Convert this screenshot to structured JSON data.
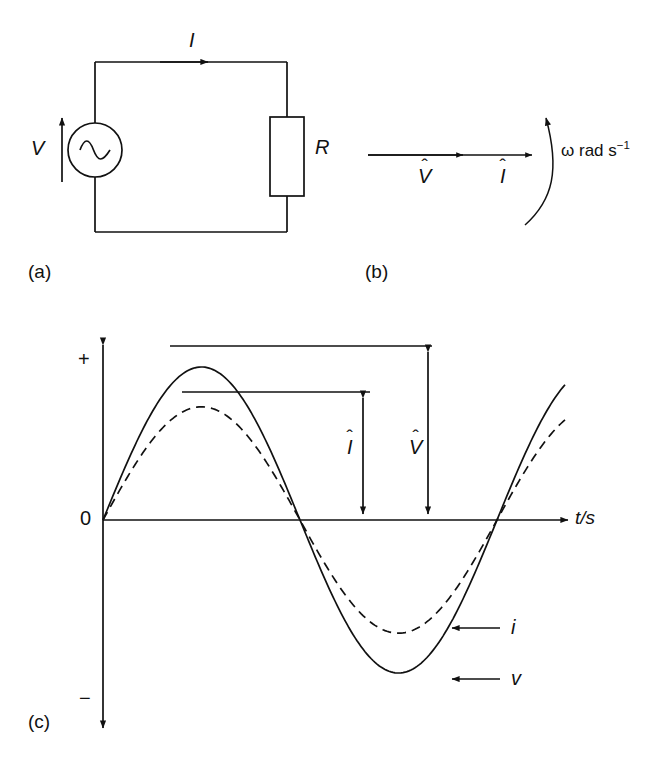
{
  "figure": {
    "panels": [
      {
        "id": "a",
        "label": "(a)",
        "caption_role": "ac-circuit-diagram"
      },
      {
        "id": "b",
        "label": "(b)",
        "caption_role": "phasor-diagram"
      },
      {
        "id": "c",
        "label": "(c)",
        "caption_role": "waveform-plot"
      }
    ],
    "colors": {
      "ink": "#111111",
      "background": "#ffffff"
    }
  },
  "circuit": {
    "source_label": "V",
    "source_symbol": "sine-wave",
    "current_label": "I",
    "resistor_label": "R",
    "voltage_arrow_direction": "up",
    "current_arrow_direction": "right"
  },
  "phasor": {
    "voltage_label": "V",
    "voltage_hat": "ˆ",
    "current_label": "I",
    "current_hat": "ˆ",
    "angular_velocity": "ω rad s",
    "angular_velocity_exponent": "−1",
    "rotation_direction": "counterclockwise",
    "phase_difference_deg": 0
  },
  "plot": {
    "y_axis_plus": "+",
    "y_axis_minus": "−",
    "y_axis_zero": "0",
    "x_axis_label": "t/s",
    "amplitude_current_label": "I",
    "amplitude_current_hat": "ˆ",
    "amplitude_voltage_label": "V",
    "amplitude_voltage_hat": "ˆ",
    "curve_current_label": "i",
    "curve_voltage_label": "v"
  },
  "chart_data": {
    "type": "line",
    "title": "",
    "xlabel": "t/s",
    "ylabel": "",
    "grid": false,
    "legend": "inline-leader-labels",
    "x_range_periods": [
      0,
      1.05
    ],
    "series": [
      {
        "name": "v",
        "style": "solid",
        "waveform": "sine",
        "amplitude": 1.0,
        "phase_deg": 0,
        "peak_label": "V̂",
        "zero_crossings_periods": [
          0,
          0.5,
          1.0
        ],
        "peak_at_period": 0.25,
        "trough_at_period": 0.75
      },
      {
        "name": "i",
        "style": "dashed",
        "waveform": "sine",
        "amplitude": 0.74,
        "phase_deg": 0,
        "peak_label": "Î",
        "zero_crossings_periods": [
          0,
          0.5,
          1.0
        ],
        "peak_at_period": 0.25,
        "trough_at_period": 0.75
      }
    ],
    "annotations": [
      {
        "text": "V̂",
        "kind": "double-arrow-amplitude",
        "series": "v"
      },
      {
        "text": "Î",
        "kind": "double-arrow-amplitude",
        "series": "i"
      },
      {
        "text": "i",
        "kind": "leader-arrow",
        "series": "i"
      },
      {
        "text": "v",
        "kind": "leader-arrow",
        "series": "v"
      },
      {
        "text": "+",
        "kind": "axis-extreme"
      },
      {
        "text": "−",
        "kind": "axis-extreme"
      },
      {
        "text": "0",
        "kind": "axis-origin"
      }
    ]
  }
}
